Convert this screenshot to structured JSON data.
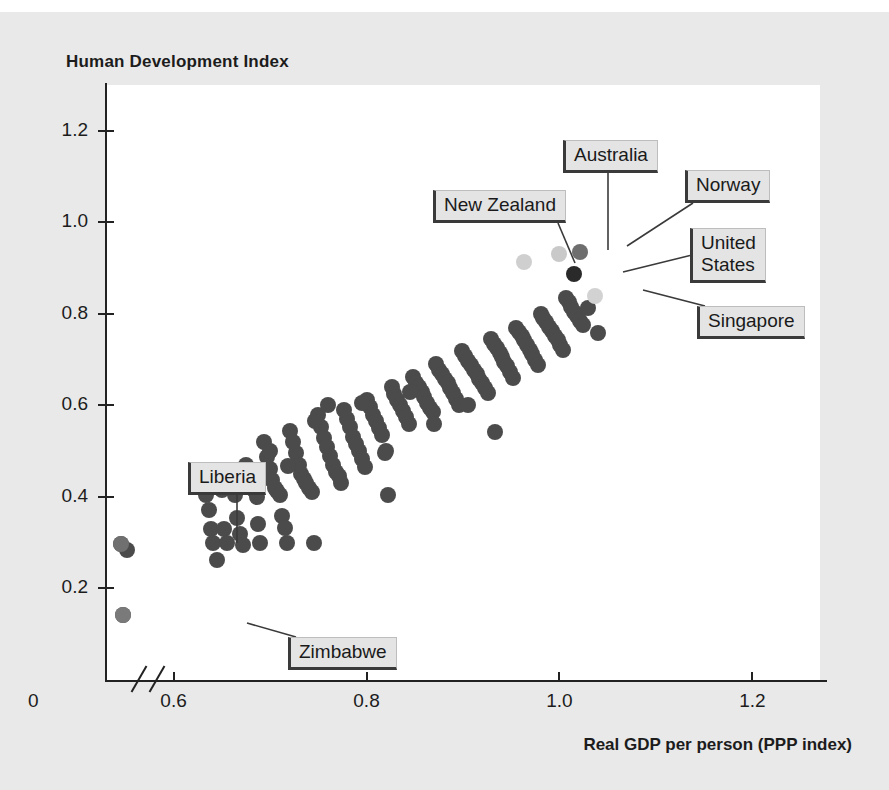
{
  "chart_data": {
    "type": "scatter",
    "title": "Human Development Index",
    "xlabel": "Real GDP per person (PPP index)",
    "ylabel": "Human Development Index",
    "xlim": [
      0.53,
      1.27
    ],
    "ylim": [
      0.0,
      1.3
    ],
    "x_ticks": [
      0.6,
      0.8,
      1.0,
      1.2
    ],
    "x_tick_labels": [
      "0.6",
      "0.8",
      "1.0",
      "1.2"
    ],
    "y_ticks": [
      0.2,
      0.4,
      0.6,
      0.8,
      1.0,
      1.2
    ],
    "y_tick_labels": [
      "0.2",
      "0.4",
      "0.6",
      "0.8",
      "1.0",
      "1.2"
    ],
    "origin_label": "0",
    "axis_break": true,
    "grid": false,
    "legend": "none",
    "marker_shape": "circle",
    "marker_color": "#4b4b4b",
    "highlight_colors": {
      "united_states": "#2a2a2a",
      "norway": "#6e6e6e",
      "australia": "#c9c9c9",
      "new_zealand": "#cfcfcf",
      "singapore": "#d2d2d2",
      "liberia": "#707070",
      "zimbabwe": "#7a7a7a"
    },
    "points": [
      [
        0.546,
        0.297
      ],
      [
        0.552,
        0.283
      ],
      [
        0.548,
        0.141
      ],
      [
        0.63,
        0.445
      ],
      [
        0.634,
        0.405
      ],
      [
        0.637,
        0.372
      ],
      [
        0.639,
        0.33
      ],
      [
        0.641,
        0.3
      ],
      [
        0.645,
        0.262
      ],
      [
        0.65,
        0.415
      ],
      [
        0.652,
        0.33
      ],
      [
        0.655,
        0.3
      ],
      [
        0.658,
        0.455
      ],
      [
        0.662,
        0.43
      ],
      [
        0.664,
        0.405
      ],
      [
        0.666,
        0.355
      ],
      [
        0.669,
        0.32
      ],
      [
        0.672,
        0.295
      ],
      [
        0.675,
        0.47
      ],
      [
        0.677,
        0.445
      ],
      [
        0.68,
        0.425
      ],
      [
        0.683,
        0.415
      ],
      [
        0.686,
        0.4
      ],
      [
        0.688,
        0.34
      ],
      [
        0.69,
        0.3
      ],
      [
        0.694,
        0.52
      ],
      [
        0.697,
        0.487
      ],
      [
        0.7,
        0.462
      ],
      [
        0.702,
        0.437
      ],
      [
        0.705,
        0.42
      ],
      [
        0.707,
        0.412
      ],
      [
        0.71,
        0.405
      ],
      [
        0.712,
        0.358
      ],
      [
        0.715,
        0.332
      ],
      [
        0.718,
        0.3
      ],
      [
        0.721,
        0.545
      ],
      [
        0.724,
        0.52
      ],
      [
        0.727,
        0.495
      ],
      [
        0.73,
        0.47
      ],
      [
        0.732,
        0.45
      ],
      [
        0.735,
        0.44
      ],
      [
        0.737,
        0.43
      ],
      [
        0.74,
        0.42
      ],
      [
        0.743,
        0.41
      ],
      [
        0.746,
        0.3
      ],
      [
        0.75,
        0.58
      ],
      [
        0.753,
        0.553
      ],
      [
        0.756,
        0.528
      ],
      [
        0.759,
        0.508
      ],
      [
        0.762,
        0.49
      ],
      [
        0.765,
        0.47
      ],
      [
        0.768,
        0.455
      ],
      [
        0.771,
        0.445
      ],
      [
        0.774,
        0.43
      ],
      [
        0.777,
        0.59
      ],
      [
        0.78,
        0.57
      ],
      [
        0.783,
        0.552
      ],
      [
        0.786,
        0.53
      ],
      [
        0.789,
        0.515
      ],
      [
        0.792,
        0.5
      ],
      [
        0.795,
        0.482
      ],
      [
        0.798,
        0.465
      ],
      [
        0.801,
        0.612
      ],
      [
        0.804,
        0.597
      ],
      [
        0.807,
        0.58
      ],
      [
        0.81,
        0.565
      ],
      [
        0.813,
        0.55
      ],
      [
        0.816,
        0.535
      ],
      [
        0.819,
        0.497
      ],
      [
        0.822,
        0.405
      ],
      [
        0.826,
        0.64
      ],
      [
        0.829,
        0.625
      ],
      [
        0.832,
        0.612
      ],
      [
        0.835,
        0.6
      ],
      [
        0.838,
        0.588
      ],
      [
        0.841,
        0.575
      ],
      [
        0.844,
        0.56
      ],
      [
        0.848,
        0.662
      ],
      [
        0.851,
        0.65
      ],
      [
        0.854,
        0.64
      ],
      [
        0.857,
        0.63
      ],
      [
        0.86,
        0.618
      ],
      [
        0.863,
        0.605
      ],
      [
        0.866,
        0.595
      ],
      [
        0.869,
        0.585
      ],
      [
        0.872,
        0.69
      ],
      [
        0.875,
        0.678
      ],
      [
        0.878,
        0.668
      ],
      [
        0.881,
        0.658
      ],
      [
        0.884,
        0.648
      ],
      [
        0.887,
        0.638
      ],
      [
        0.89,
        0.628
      ],
      [
        0.893,
        0.615
      ],
      [
        0.896,
        0.6
      ],
      [
        0.899,
        0.718
      ],
      [
        0.902,
        0.708
      ],
      [
        0.905,
        0.698
      ],
      [
        0.908,
        0.688
      ],
      [
        0.911,
        0.678
      ],
      [
        0.914,
        0.668
      ],
      [
        0.917,
        0.658
      ],
      [
        0.92,
        0.648
      ],
      [
        0.923,
        0.638
      ],
      [
        0.926,
        0.628
      ],
      [
        0.929,
        0.745
      ],
      [
        0.932,
        0.735
      ],
      [
        0.935,
        0.725
      ],
      [
        0.938,
        0.715
      ],
      [
        0.94,
        0.705
      ],
      [
        0.943,
        0.695
      ],
      [
        0.946,
        0.685
      ],
      [
        0.949,
        0.672
      ],
      [
        0.952,
        0.66
      ],
      [
        0.955,
        0.77
      ],
      [
        0.958,
        0.76
      ],
      [
        0.961,
        0.752
      ],
      [
        0.963,
        0.742
      ],
      [
        0.966,
        0.733
      ],
      [
        0.969,
        0.722
      ],
      [
        0.972,
        0.712
      ],
      [
        0.975,
        0.7
      ],
      [
        0.978,
        0.688
      ],
      [
        0.981,
        0.8
      ],
      [
        0.983,
        0.79
      ],
      [
        0.986,
        0.782
      ],
      [
        0.989,
        0.772
      ],
      [
        0.992,
        0.762
      ],
      [
        0.995,
        0.752
      ],
      [
        0.998,
        0.742
      ],
      [
        1.001,
        0.732
      ],
      [
        1.004,
        0.722
      ],
      [
        1.007,
        0.835
      ],
      [
        1.01,
        0.825
      ],
      [
        1.012,
        0.815
      ],
      [
        1.015,
        0.805
      ],
      [
        1.018,
        0.795
      ],
      [
        1.021,
        0.785
      ],
      [
        1.024,
        0.775
      ],
      [
        0.933,
        0.542
      ],
      [
        0.82,
        0.5
      ],
      [
        1.03,
        0.812
      ],
      [
        1.04,
        0.758
      ],
      [
        0.905,
        0.6
      ],
      [
        0.87,
        0.56
      ],
      [
        0.845,
        0.63
      ],
      [
        0.795,
        0.605
      ],
      [
        0.76,
        0.6
      ],
      [
        0.747,
        0.565
      ],
      [
        0.719,
        0.468
      ],
      [
        0.7,
        0.5
      ]
    ],
    "highlighted_points": [
      {
        "name": "New Zealand",
        "x": 0.963,
        "y": 0.913,
        "color": "#cfcfcf"
      },
      {
        "name": "Australia",
        "x": 1.0,
        "y": 0.93,
        "color": "#c9c9c9"
      },
      {
        "name": "Norway",
        "x": 1.021,
        "y": 0.936,
        "color": "#6e6e6e"
      },
      {
        "name": "United States",
        "x": 1.015,
        "y": 0.888,
        "color": "#2a2a2a"
      },
      {
        "name": "Singapore",
        "x": 1.037,
        "y": 0.84,
        "color": "#d2d2d2"
      },
      {
        "name": "Liberia",
        "x": 0.546,
        "y": 0.297,
        "color": "#707070"
      },
      {
        "name": "Zimbabwe",
        "x": 0.548,
        "y": 0.141,
        "color": "#7a7a7a"
      }
    ],
    "annotations": [
      {
        "id": "new-zealand",
        "label": "New Zealand",
        "box_px": [
          433,
          190
        ],
        "anchor_px": [
          575,
          263
        ]
      },
      {
        "id": "australia",
        "label": "Australia",
        "box_px": [
          563,
          140
        ],
        "anchor_px": [
          608,
          250
        ]
      },
      {
        "id": "norway",
        "label": "Norway",
        "box_px": [
          685,
          170
        ],
        "anchor_px": [
          627,
          246
        ]
      },
      {
        "id": "united-states",
        "label": "United\nStates",
        "box_px": [
          690,
          228
        ],
        "anchor_px": [
          623,
          272
        ]
      },
      {
        "id": "singapore",
        "label": "Singapore",
        "box_px": [
          697,
          306
        ],
        "anchor_px": [
          643,
          290
        ]
      },
      {
        "id": "liberia",
        "label": "Liberia",
        "box_px": [
          188,
          462
        ],
        "anchor_px": [
          237,
          543
        ]
      },
      {
        "id": "zimbabwe",
        "label": "Zimbabwe",
        "box_px": [
          288,
          637
        ],
        "anchor_px": [
          247,
          623
        ]
      }
    ]
  },
  "axis": {
    "title": "Human Development Index",
    "x_title": "Real GDP per person (PPP index)",
    "origin": "0",
    "x_labels": [
      "0.6",
      "0.8",
      "1.0",
      "1.2"
    ],
    "y_labels": [
      "1.2",
      "1.0",
      "0.8",
      "0.6",
      "0.4",
      "0.2"
    ]
  },
  "labels": {
    "new_zealand": "New Zealand",
    "australia": "Australia",
    "norway": "Norway",
    "united_states": "United States",
    "singapore": "Singapore",
    "liberia": "Liberia",
    "zimbabwe": "Zimbabwe"
  }
}
